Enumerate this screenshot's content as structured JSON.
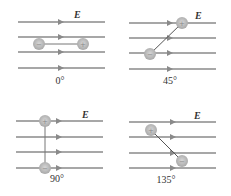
{
  "field_label": "E",
  "panels": [
    {
      "angle_label": "0°"
    },
    {
      "angle_label": "45°"
    },
    {
      "angle_label": "90°"
    },
    {
      "angle_label": "135°"
    }
  ],
  "charges": {
    "positive": "+",
    "negative": "−"
  },
  "colors": {
    "field_line": "#8a8a8a",
    "charge_fill": "#b8b8b8",
    "dipole_bar": "#555555"
  }
}
